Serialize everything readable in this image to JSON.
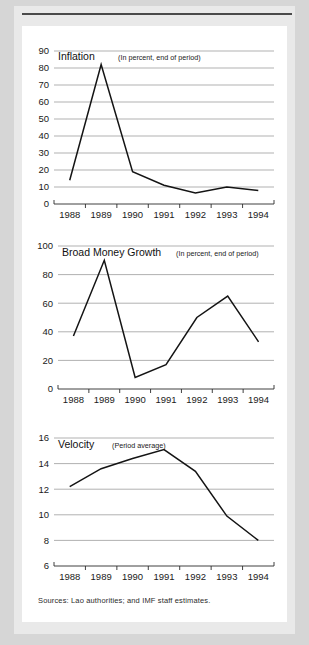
{
  "figure": {
    "source_note": "Sources: Lao authorities; and IMF staff estimates."
  },
  "panels": {
    "inflation": {
      "title": "Inflation",
      "subtitle": "(In percent, end of period)"
    },
    "money": {
      "title": "Broad Money Growth",
      "subtitle": "(In percent, end of period)"
    },
    "velocity": {
      "title": "Velocity",
      "subtitle": "(Period average)"
    }
  },
  "chart_data": [
    {
      "type": "line",
      "title": "Inflation",
      "subtitle": "(In percent, end of period)",
      "xlabel": "",
      "ylabel": "",
      "x": [
        "1988",
        "1989",
        "1990",
        "1991",
        "1992",
        "1993",
        "1994"
      ],
      "categories": [
        "1988",
        "1989",
        "1990",
        "1991",
        "1992",
        "1993",
        "1994"
      ],
      "values": [
        14,
        82,
        19,
        11,
        6.5,
        10,
        8
      ],
      "series": [
        {
          "name": "Inflation",
          "values": [
            14,
            82,
            19,
            11,
            6.5,
            10,
            8
          ]
        }
      ],
      "ylim": [
        0,
        90
      ],
      "yticks": [
        0,
        10,
        20,
        30,
        40,
        50,
        60,
        70,
        80,
        90
      ],
      "ytick_labels": [
        "0",
        "10",
        "20",
        "30",
        "40",
        "50",
        "60",
        "70",
        "80",
        "90"
      ],
      "xtick_labels": [
        "1988",
        "1989",
        "1990",
        "1991",
        "1992",
        "1993",
        "1994"
      ],
      "grid": true,
      "legend": "none"
    },
    {
      "type": "line",
      "title": "Broad Money Growth",
      "subtitle": "(In percent, end of period)",
      "xlabel": "",
      "ylabel": "",
      "x": [
        "1988",
        "1989",
        "1990",
        "1991",
        "1992",
        "1993",
        "1994"
      ],
      "categories": [
        "1988",
        "1989",
        "1990",
        "1991",
        "1992",
        "1993",
        "1994"
      ],
      "values": [
        37,
        90,
        8,
        17,
        50,
        65,
        33
      ],
      "series": [
        {
          "name": "Broad Money Growth",
          "values": [
            37,
            90,
            8,
            17,
            50,
            65,
            33
          ]
        }
      ],
      "ylim": [
        0,
        100
      ],
      "yticks": [
        0,
        20,
        40,
        60,
        80,
        100
      ],
      "ytick_labels": [
        "0",
        "20",
        "40",
        "60",
        "80",
        "100"
      ],
      "xtick_labels": [
        "1988",
        "1989",
        "1990",
        "1991",
        "1992",
        "1993",
        "1994"
      ],
      "grid": true,
      "legend": "none"
    },
    {
      "type": "line",
      "title": "Velocity",
      "subtitle": "(Period average)",
      "xlabel": "",
      "ylabel": "",
      "x": [
        "1988",
        "1989",
        "1990",
        "1991",
        "1992",
        "1993",
        "1994"
      ],
      "categories": [
        "1988",
        "1989",
        "1990",
        "1991",
        "1992",
        "1993",
        "1994"
      ],
      "values": [
        12.2,
        13.6,
        14.4,
        15.1,
        13.4,
        9.9,
        8.0
      ],
      "series": [
        {
          "name": "Velocity",
          "values": [
            12.2,
            13.6,
            14.4,
            15.1,
            13.4,
            9.9,
            8.0
          ]
        }
      ],
      "ylim": [
        6,
        16
      ],
      "yticks": [
        6,
        8,
        10,
        12,
        14,
        16
      ],
      "ytick_labels": [
        "6",
        "8",
        "10",
        "12",
        "14",
        "16"
      ],
      "xtick_labels": [
        "1988",
        "1989",
        "1990",
        "1991",
        "1992",
        "1993",
        "1994"
      ],
      "grid": true,
      "legend": "none"
    }
  ],
  "colors": {
    "line": "#141414",
    "grid": "#8f8f8f",
    "axis": "#2b2b2b",
    "card_bg": "#ffffff",
    "page_bg": "#e9e9e9"
  }
}
